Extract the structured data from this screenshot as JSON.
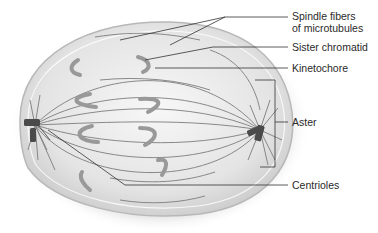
{
  "diagram": {
    "labels": [
      {
        "id": "spindle",
        "line1": "Spindle fibers",
        "line2": "of microtubules"
      },
      {
        "id": "sister",
        "text": "Sister chromatid"
      },
      {
        "id": "kinetochore",
        "text": "Kinetochore"
      },
      {
        "id": "aster",
        "text": "Aster"
      },
      {
        "id": "centrioles",
        "text": "Centrioles"
      }
    ],
    "colors": {
      "cell_fill": "#e2e2e2",
      "cell_edge": "#bdbdbd",
      "chromosome": "#9a9a9a",
      "fiber": "#7a7a7a",
      "leader_line": "#333333",
      "centriole": "#4a4a4a"
    }
  }
}
